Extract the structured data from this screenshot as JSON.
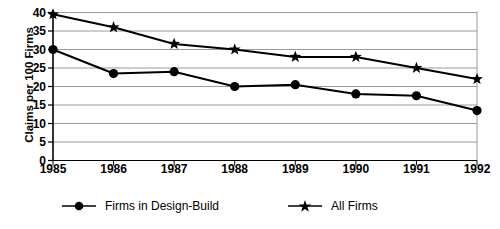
{
  "chart_data": {
    "type": "line",
    "title": "",
    "xlabel": "",
    "ylabel": "Claims per 100 Firms",
    "x": [
      1985,
      1986,
      1987,
      1988,
      1989,
      1990,
      1991,
      1992
    ],
    "xticklabels": [
      "1985",
      "1986",
      "1987",
      "1988",
      "1989",
      "1990",
      "1991",
      "1992"
    ],
    "yticklabels": [
      "0",
      "5",
      "10",
      "15",
      "20",
      "25",
      "30",
      "35",
      "40"
    ],
    "yticks": [
      0,
      5,
      10,
      15,
      20,
      25,
      30,
      35,
      40
    ],
    "ylim": [
      0,
      40
    ],
    "xlim": [
      1985,
      1992
    ],
    "grid": "horizontal",
    "legend_position": "bottom",
    "series": [
      {
        "name": "Firms in Design-Build",
        "marker": "circle",
        "color": "#000000",
        "values": [
          30,
          23.5,
          24,
          20,
          20.5,
          18,
          17.5,
          13.5
        ]
      },
      {
        "name": "All Firms",
        "marker": "star",
        "color": "#000000",
        "values": [
          39.5,
          36,
          31.5,
          30,
          28,
          28,
          25,
          22
        ]
      }
    ]
  },
  "legend": {
    "entries": [
      {
        "label": "Firms in Design-Build",
        "marker": "circle-marker"
      },
      {
        "label": "All Firms",
        "marker": "star-marker"
      }
    ]
  },
  "colors": {
    "axis": "#000000",
    "gridline": "#9a9a9a",
    "series": "#000000",
    "background": "#ffffff"
  }
}
